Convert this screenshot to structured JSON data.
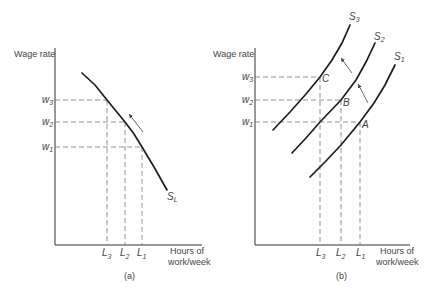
{
  "panel_a": {
    "caption": "(a)",
    "y_axis_label": "Wage rate",
    "x_axis_label_line1": "Hours of",
    "x_axis_label_line2": "work/week",
    "wage_levels": [
      {
        "base": "w",
        "sub": "3",
        "y": 100,
        "x_end": 107
      },
      {
        "base": "w",
        "sub": "2",
        "y": 122,
        "x_end": 125
      },
      {
        "base": "w",
        "sub": "1",
        "y": 147,
        "x_end": 142
      }
    ],
    "hour_levels": [
      {
        "base": "L",
        "sub": "3",
        "x": 107,
        "y_top": 100
      },
      {
        "base": "L",
        "sub": "2",
        "x": 125,
        "y_top": 122
      },
      {
        "base": "L",
        "sub": "1",
        "x": 142,
        "y_top": 147
      }
    ],
    "curve": {
      "base": "S",
      "sub": "L",
      "points": "82,73 95,85 107,100 116,111 125,122 134,134 142,147 154,167 167,190"
    }
  },
  "panel_b": {
    "caption": "(b)",
    "y_axis_label": "Wage rate",
    "x_axis_label_line1": "Hours of",
    "x_axis_label_line2": "work/week",
    "wage_levels": [
      {
        "base": "w",
        "sub": "3",
        "y": 77,
        "x_end": 320
      },
      {
        "base": "w",
        "sub": "2",
        "y": 100,
        "x_end": 341
      },
      {
        "base": "w",
        "sub": "1",
        "y": 122,
        "x_end": 360
      }
    ],
    "hour_levels": [
      {
        "base": "L",
        "sub": "3",
        "x": 320,
        "y_top": 77
      },
      {
        "base": "L",
        "sub": "2",
        "x": 341,
        "y_top": 100
      },
      {
        "base": "L",
        "sub": "1",
        "x": 360,
        "y_top": 122
      }
    ],
    "curves": [
      {
        "base": "S",
        "sub": "3",
        "points": "273,130 290,112 306,94 320,77 332,60 342,43 350,25"
      },
      {
        "base": "S",
        "sub": "2",
        "points": "292,153 306,138 320,122 341,100 356,80 366,62 375,43"
      },
      {
        "base": "S",
        "sub": "1",
        "points": "310,177 325,162 341,145 360,122 374,103 385,85 395,65"
      }
    ],
    "points": [
      "C",
      "B",
      "A"
    ]
  }
}
